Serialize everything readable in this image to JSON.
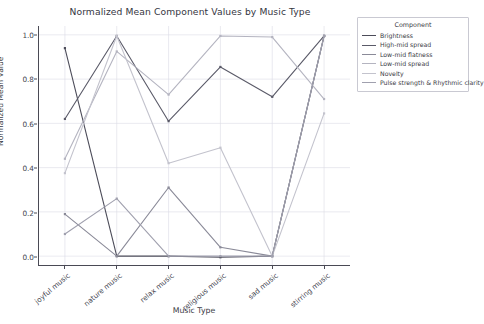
{
  "chart_data": {
    "type": "line",
    "title": "Normalized Mean Component Values by Music Type",
    "xlabel": "Music Type",
    "ylabel": "Normalized Mean Value",
    "categories": [
      "joyful music",
      "nature music",
      "relax music",
      "religious music",
      "sad music",
      "stirring music"
    ],
    "ylim": [
      -0.04,
      1.04
    ],
    "yticks": [
      "0.0",
      "0.2",
      "0.4",
      "0.6",
      "0.8",
      "1.0"
    ],
    "ytick_values": [
      0.0,
      0.2,
      0.4,
      0.6,
      0.8,
      1.0
    ],
    "grid": true,
    "legend_position": "upper right outside",
    "legend_title": "Component",
    "series": [
      {
        "name": "Brightness",
        "color": "#4c4c59",
        "values": [
          0.94,
          0.0,
          0.0,
          -0.005,
          0.0,
          0.995
        ]
      },
      {
        "name": "High-mid spread",
        "color": "#5a5a68",
        "values": [
          0.62,
          0.995,
          0.61,
          0.855,
          0.72,
          0.995
        ]
      },
      {
        "name": "Low-mid flatness",
        "color": "#8a8a98",
        "values": [
          0.19,
          0.0,
          0.31,
          0.04,
          0.0,
          0.995
        ]
      },
      {
        "name": "Low-mid spread",
        "color": "#b4b4c0",
        "values": [
          0.44,
          0.925,
          0.73,
          0.995,
          0.99,
          0.71
        ]
      },
      {
        "name": "Novelty",
        "color": "#c3c3cd",
        "values": [
          0.375,
          0.995,
          0.42,
          0.49,
          0.0,
          0.645
        ]
      },
      {
        "name": "Pulse strength & Rhythmic clarity",
        "color": "#a0a0ae",
        "values": [
          0.1,
          0.26,
          0.0,
          0.0,
          0.0,
          0.995
        ]
      }
    ]
  }
}
